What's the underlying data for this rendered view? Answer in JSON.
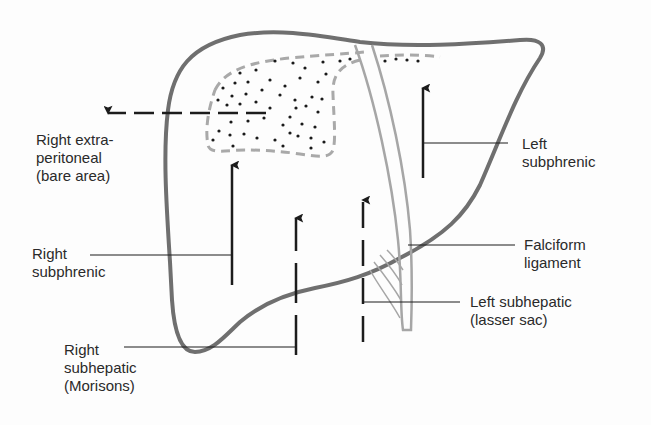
{
  "diagram": {
    "colors": {
      "outline": "#6f6f6f",
      "ligament": "#a6a6a6",
      "dashed_border": "#a9a9a9",
      "arrow": "#1c1c1c",
      "text": "#2a2a2a",
      "dots": "#1a1a1a"
    },
    "labels": {
      "right_extraperitoneal": "Right extra-\nperitoneal\n(bare area)",
      "right_subphrenic": "Right\nsubphrenic",
      "right_subhepatic": "Right\nsubhepatic\n(Morisons)",
      "left_subphrenic": "Left\nsubphrenic",
      "falciform_ligament": "Falciform\nligament",
      "left_subhepatic": "Left subhepatic\n(lasser sac)"
    },
    "structures": [
      "liver-outline",
      "bare-area-stippled-region",
      "falciform-ligament",
      "right-extraperitoneal-arrow",
      "right-subphrenic-arrow",
      "right-subhepatic-arrow",
      "left-subhepatic-arrow",
      "left-subphrenic-arrow"
    ]
  }
}
